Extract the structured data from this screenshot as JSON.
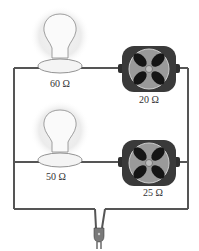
{
  "diagram": {
    "type": "parallel circuit",
    "branches": [
      {
        "bulb": {
          "resistance": "60 Ω"
        },
        "fan": {
          "resistance": "20 Ω"
        }
      },
      {
        "bulb": {
          "resistance": "50 Ω"
        },
        "fan": {
          "resistance": "25 Ω"
        }
      }
    ],
    "source": "wall-plug"
  },
  "colors": {
    "wire": "#555555",
    "glow": "#ececec",
    "fan_body": "#3a3a3a",
    "fan_disc": "#9a9a9a",
    "text": "#333333"
  }
}
